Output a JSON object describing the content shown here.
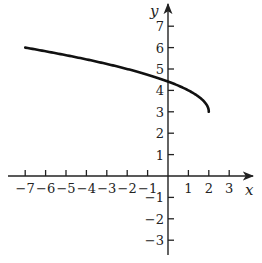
{
  "chart_data": {
    "type": "line",
    "title": "",
    "xlabel": "x",
    "ylabel": "y",
    "xlim": [
      -7.5,
      4
    ],
    "ylim": [
      -3.8,
      8
    ],
    "x_ticks": [
      -7,
      -6,
      -5,
      -4,
      -3,
      -2,
      -1,
      1,
      2,
      3
    ],
    "y_ticks": [
      -3,
      -2,
      -1,
      1,
      2,
      3,
      4,
      5,
      6,
      7
    ],
    "grid": false,
    "legend": null,
    "function": "y = sqrt(2 - x) + 3",
    "domain": [
      -7,
      2
    ],
    "series": [
      {
        "name": "curve",
        "x": [
          -7,
          -6,
          -5,
          -4,
          -3,
          -2,
          -1,
          0,
          1,
          1.5,
          1.8,
          2
        ],
        "y": [
          6,
          5.83,
          5.65,
          5.45,
          5.24,
          5,
          4.73,
          4.41,
          4,
          3.71,
          3.45,
          3
        ]
      }
    ],
    "color": "#111111"
  }
}
